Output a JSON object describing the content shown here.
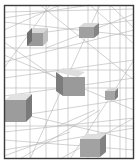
{
  "artwork": {
    "description": "Abstract wireframe perspective drawing with floating grey cubes",
    "colors": {
      "background": "#ffffff",
      "frame": "#3a3a3a",
      "lines": "#b4b4b4",
      "cube_front": "#9a9a9a",
      "cube_side": "#7c7c7c",
      "cube_top": "#d8d8d8"
    },
    "frame": {
      "x": 4,
      "y": 5,
      "w": 130,
      "h": 154
    },
    "cubes": [
      {
        "id": "cube-top-left",
        "x": 27,
        "y": 33,
        "w": 16,
        "h": 13,
        "depth": 5
      },
      {
        "id": "cube-top-right",
        "x": 79,
        "y": 27,
        "w": 15,
        "h": 11,
        "depth": 5
      },
      {
        "id": "cube-center",
        "x": 60,
        "y": 76,
        "w": 25,
        "h": 19,
        "depth": 7
      },
      {
        "id": "cube-right",
        "x": 105,
        "y": 91,
        "w": 11,
        "h": 9,
        "depth": 4
      },
      {
        "id": "cube-left",
        "x": 5,
        "y": 101,
        "w": 24,
        "h": 21,
        "depth": 6
      },
      {
        "id": "cube-bottom",
        "x": 80,
        "y": 138,
        "w": 24,
        "h": 18,
        "depth": 6
      }
    ]
  }
}
